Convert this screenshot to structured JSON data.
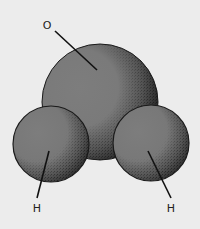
{
  "diagram": {
    "type": "space-filling molecular model",
    "molecule": "water",
    "background_color": "#ececec",
    "atom_fill_color": "#7b7b7b",
    "atom_shadow_color": "#1e1e1e",
    "outline_color": "#1a1a1a",
    "atoms": [
      {
        "id": "oxygen",
        "label": "O",
        "cx": 100,
        "cy": 102,
        "r": 58,
        "label_x": 47,
        "label_y": 29,
        "leader": {
          "x1": 55,
          "y1": 31,
          "x2": 97,
          "y2": 70
        }
      },
      {
        "id": "hydrogen-left",
        "label": "H",
        "cx": 51,
        "cy": 144,
        "r": 38,
        "label_x": 37,
        "label_y": 212,
        "leader": {
          "x1": 49,
          "y1": 151,
          "x2": 37,
          "y2": 198
        }
      },
      {
        "id": "hydrogen-right",
        "label": "H",
        "cx": 151,
        "cy": 143,
        "r": 38,
        "label_x": 171,
        "label_y": 212,
        "leader": {
          "x1": 148,
          "y1": 151,
          "x2": 171,
          "y2": 198
        }
      }
    ]
  }
}
